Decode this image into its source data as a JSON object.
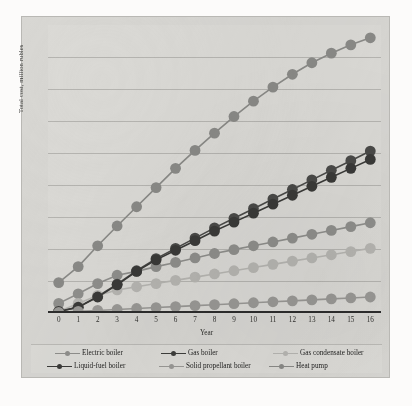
{
  "chart_data": {
    "type": "line",
    "title": "",
    "xlabel": "Year",
    "ylabel": "Total cost, million rubles",
    "x": [
      0,
      1,
      2,
      3,
      4,
      5,
      6,
      7,
      8,
      9,
      10,
      11,
      12,
      13,
      14,
      15,
      16
    ],
    "xticklabels": [
      "0",
      "1",
      "2",
      "3",
      "4",
      "5",
      "6",
      "7",
      "8",
      "9",
      "10",
      "11",
      "12",
      "13",
      "14",
      "15",
      "16"
    ],
    "xlim": [
      -0.55,
      16.55
    ],
    "ylim": [
      0,
      9
    ],
    "ytick_values": [
      1,
      2,
      3,
      4,
      5,
      6,
      7,
      8
    ],
    "yticklabels": [],
    "grid": "horizontal",
    "legend_position": "bottom",
    "series": [
      {
        "name": "Electric boiler",
        "color": "#8f8f8c",
        "marker": "circle",
        "values": [
          0.3,
          0.6,
          0.92,
          1.18,
          1.3,
          1.45,
          1.58,
          1.72,
          1.86,
          1.98,
          2.1,
          2.22,
          2.34,
          2.46,
          2.58,
          2.7,
          2.82
        ]
      },
      {
        "name": "Gas boiler",
        "color": "#4a4a48",
        "marker": "circle",
        "values": [
          0.05,
          0.18,
          0.52,
          0.9,
          1.32,
          1.7,
          2.02,
          2.34,
          2.66,
          2.96,
          3.26,
          3.56,
          3.86,
          4.16,
          4.46,
          4.76,
          5.06
        ]
      },
      {
        "name": "Gas condensate boiler",
        "color": "#b7b6b2",
        "marker": "circle",
        "values": [
          0.05,
          0.3,
          0.55,
          0.72,
          0.82,
          0.92,
          1.02,
          1.12,
          1.22,
          1.32,
          1.42,
          1.52,
          1.62,
          1.72,
          1.82,
          1.92,
          2.02
        ]
      },
      {
        "name": "Liquid-fuel boiler",
        "color": "#3a3a38",
        "marker": "circle",
        "values": [
          0.05,
          0.18,
          0.5,
          0.88,
          1.3,
          1.66,
          1.96,
          2.26,
          2.56,
          2.84,
          3.12,
          3.4,
          3.68,
          3.96,
          4.24,
          4.52,
          4.8
        ]
      },
      {
        "name": "Solid propellant boiler",
        "color": "#9a9996",
        "marker": "circle",
        "values": [
          0.02,
          0.05,
          0.08,
          0.11,
          0.14,
          0.17,
          0.2,
          0.23,
          0.26,
          0.29,
          0.32,
          0.35,
          0.38,
          0.41,
          0.44,
          0.47,
          0.5
        ]
      },
      {
        "name": "Heat pump",
        "color": "#8a8a87",
        "marker": "circle",
        "values": [
          0.95,
          1.45,
          2.1,
          2.72,
          3.32,
          3.92,
          4.52,
          5.08,
          5.62,
          6.14,
          6.62,
          7.06,
          7.46,
          7.82,
          8.12,
          8.38,
          8.6
        ]
      }
    ]
  },
  "legend": {
    "row1": [
      {
        "label": "Electric boiler",
        "color": "#8f8f8c"
      },
      {
        "label": "Gas boiler",
        "color": "#3e3e3c"
      },
      {
        "label": "Gas condensate boiler",
        "color": "#b7b6b2"
      }
    ],
    "row2": [
      {
        "label": "Liquid-fuel boiler",
        "color": "#3a3a38"
      },
      {
        "label": "Solid propellant boiler",
        "color": "#9a9996"
      },
      {
        "label": "Heat pump",
        "color": "#8a8a87"
      }
    ]
  }
}
